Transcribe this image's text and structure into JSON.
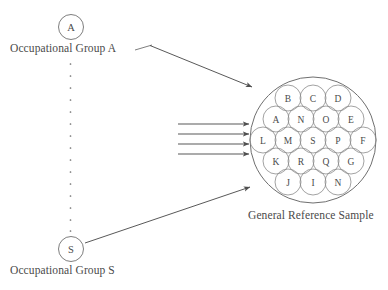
{
  "figure": {
    "title_visible": false,
    "background_color": "#ffffff",
    "line_color": "#6f6f6f",
    "text_color": "#4a4a4a"
  },
  "groups": {
    "first": {
      "node_letter": "A",
      "label": "Occupational Group A"
    },
    "last": {
      "node_letter": "S",
      "label": "Occupational Group S"
    },
    "ellipsis_dot_count": 14
  },
  "reference_sample": {
    "label": "General Reference Sample",
    "rows": [
      {
        "letters": [
          "B",
          "C",
          "D"
        ]
      },
      {
        "letters": [
          "A",
          "N",
          "O",
          "E"
        ]
      },
      {
        "letters": [
          "L",
          "M",
          "S",
          "P",
          "F"
        ]
      },
      {
        "letters": [
          "K",
          "R",
          "Q",
          "G"
        ]
      },
      {
        "letters": [
          "J",
          "I",
          "N"
        ]
      }
    ],
    "cell_count": 19
  },
  "arrows": {
    "bundle_count": 4,
    "diagonal_from_first_group": true,
    "diagonal_from_last_group": true
  }
}
